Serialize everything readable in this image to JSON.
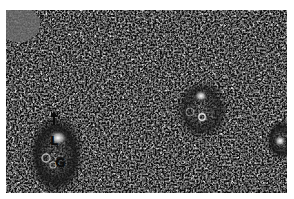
{
  "figure": {
    "type": "grayscale micrograph",
    "background": "#ffffff",
    "labels": [
      {
        "text": "L",
        "x": 50,
        "y": 137
      },
      {
        "text": "G",
        "x": 56,
        "y": 158
      }
    ],
    "arrow": {
      "direction": "up",
      "x": 54,
      "y": 115
    }
  }
}
